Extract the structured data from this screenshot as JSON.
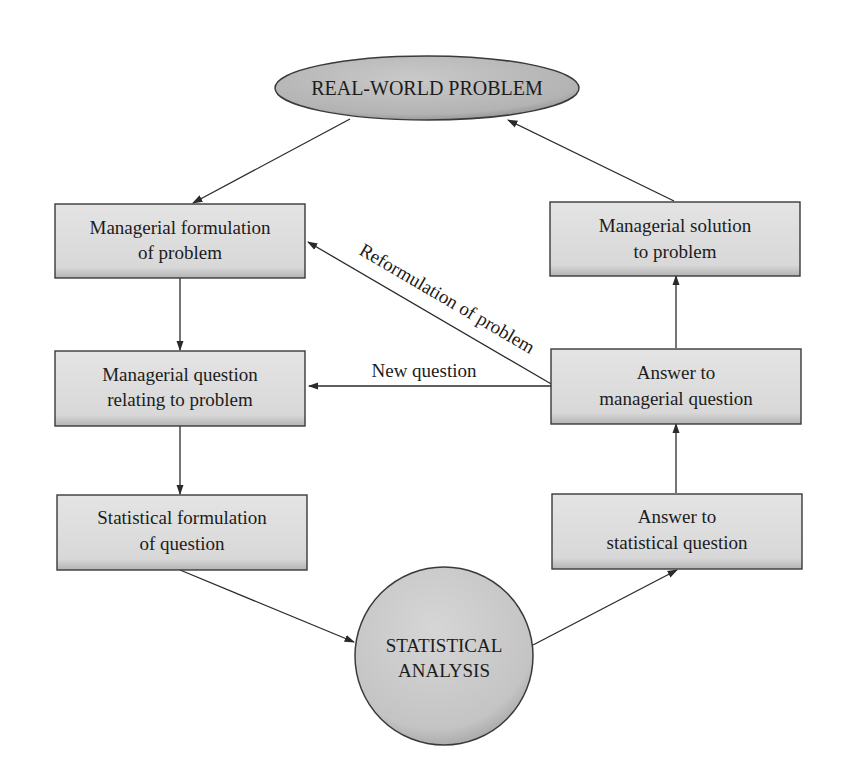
{
  "diagram": {
    "type": "flowchart",
    "colors": {
      "node_fill": "#d6d6d6",
      "node_fill_light": "#e6e6e6",
      "node_border": "#3a3a3a",
      "ellipse_fill": "#b8b8b8",
      "circle_fill": "#c4c4c4",
      "edge": "#2a2a2a",
      "background": "#ffffff"
    },
    "nodes": {
      "real_world": {
        "shape": "ellipse",
        "label": "REAL-WORLD PROBLEM"
      },
      "managerial_formulation": {
        "shape": "box",
        "line1": "Managerial formulation",
        "line2": "of problem"
      },
      "managerial_question": {
        "shape": "box",
        "line1": "Managerial question",
        "line2": "relating to problem"
      },
      "statistical_formulation": {
        "shape": "box",
        "line1": "Statistical formulation",
        "line2": "of question"
      },
      "statistical_analysis": {
        "shape": "circle",
        "line1": "STATISTICAL",
        "line2": "ANALYSIS"
      },
      "answer_statistical": {
        "shape": "box",
        "line1": "Answer to",
        "line2": "statistical question"
      },
      "answer_managerial": {
        "shape": "box",
        "line1": "Answer to",
        "line2": "managerial question"
      },
      "managerial_solution": {
        "shape": "box",
        "line1": "Managerial solution",
        "line2": "to problem"
      }
    },
    "edges": [
      {
        "from": "real_world",
        "to": "managerial_formulation",
        "label": ""
      },
      {
        "from": "managerial_formulation",
        "to": "managerial_question",
        "label": ""
      },
      {
        "from": "managerial_question",
        "to": "statistical_formulation",
        "label": ""
      },
      {
        "from": "statistical_formulation",
        "to": "statistical_analysis",
        "label": ""
      },
      {
        "from": "statistical_analysis",
        "to": "answer_statistical",
        "label": ""
      },
      {
        "from": "answer_statistical",
        "to": "answer_managerial",
        "label": ""
      },
      {
        "from": "answer_managerial",
        "to": "managerial_solution",
        "label": ""
      },
      {
        "from": "managerial_solution",
        "to": "real_world",
        "label": ""
      },
      {
        "from": "answer_managerial",
        "to": "managerial_question",
        "label": "New question"
      },
      {
        "from": "answer_managerial",
        "to": "managerial_formulation",
        "label": "Reformulation of problem"
      }
    ],
    "edge_labels": {
      "new_question": "New question",
      "reformulation": "Reformulation of problem"
    }
  }
}
